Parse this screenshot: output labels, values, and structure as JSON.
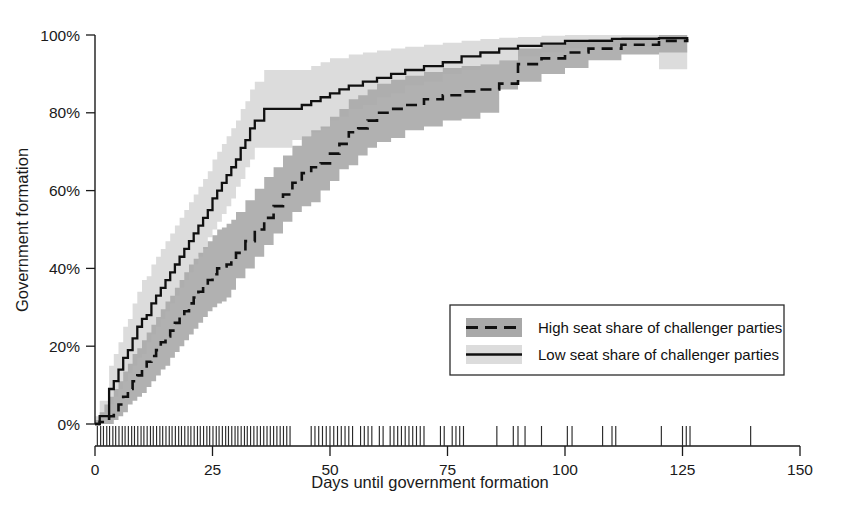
{
  "chart_data": {
    "type": "line",
    "title": "",
    "xlabel": "Days until government formation",
    "ylabel": "Government formation",
    "xlim": [
      0,
      150
    ],
    "ylim": [
      0,
      1
    ],
    "grid": false,
    "legend_position": "center-right",
    "x_ticks": [
      0,
      25,
      50,
      75,
      100,
      125,
      150
    ],
    "x_tick_labels": [
      "0",
      "25",
      "50",
      "75",
      "100",
      "125",
      "150"
    ],
    "y_ticks": [
      0,
      0.2,
      0.4,
      0.6,
      0.8,
      1.0
    ],
    "y_tick_labels": [
      "0%",
      "20%",
      "40%",
      "60%",
      "80%",
      "100%"
    ],
    "colors": {
      "curve": "#101010",
      "band_low_seat_share": "#dcdcdc",
      "band_high_seat_share": "#a8a8a8",
      "axis": "#1a1a1a",
      "background": "#ffffff"
    },
    "series": [
      {
        "name": "Low seat share of challenger parties",
        "style": "solid",
        "band_color": "#dcdcdc",
        "x": [
          0,
          1,
          2,
          3,
          4,
          5,
          6,
          7,
          8,
          9,
          10,
          11,
          12,
          13,
          14,
          15,
          16,
          17,
          18,
          19,
          20,
          21,
          22,
          23,
          24,
          25,
          26,
          27,
          28,
          29,
          30,
          31,
          32,
          33,
          34,
          36,
          38,
          40,
          42,
          44,
          46,
          48,
          50,
          52,
          54,
          57,
          60,
          63,
          66,
          70,
          74,
          78,
          82,
          86,
          90,
          95,
          100,
          110,
          120,
          126
        ],
        "y": [
          0.0,
          0.02,
          0.02,
          0.09,
          0.11,
          0.14,
          0.17,
          0.19,
          0.22,
          0.25,
          0.27,
          0.28,
          0.31,
          0.33,
          0.35,
          0.37,
          0.39,
          0.41,
          0.43,
          0.45,
          0.47,
          0.49,
          0.51,
          0.53,
          0.55,
          0.58,
          0.6,
          0.62,
          0.64,
          0.66,
          0.68,
          0.71,
          0.73,
          0.76,
          0.78,
          0.81,
          0.81,
          0.81,
          0.81,
          0.82,
          0.83,
          0.84,
          0.85,
          0.86,
          0.87,
          0.88,
          0.89,
          0.9,
          0.91,
          0.92,
          0.93,
          0.945,
          0.955,
          0.965,
          0.972,
          0.978,
          0.985,
          0.99,
          0.992,
          0.995
        ],
        "band_lower": [
          0.0,
          0.0,
          0.0,
          0.03,
          0.05,
          0.07,
          0.09,
          0.11,
          0.13,
          0.15,
          0.17,
          0.18,
          0.21,
          0.23,
          0.25,
          0.27,
          0.29,
          0.31,
          0.33,
          0.35,
          0.37,
          0.39,
          0.41,
          0.43,
          0.45,
          0.48,
          0.5,
          0.52,
          0.54,
          0.56,
          0.58,
          0.61,
          0.63,
          0.66,
          0.68,
          0.71,
          0.71,
          0.71,
          0.71,
          0.73,
          0.74,
          0.75,
          0.76,
          0.78,
          0.79,
          0.81,
          0.82,
          0.84,
          0.85,
          0.87,
          0.88,
          0.9,
          0.91,
          0.925,
          0.935,
          0.945,
          0.955,
          0.965,
          0.97,
          0.912
        ],
        "band_upper": [
          0.02,
          0.06,
          0.06,
          0.15,
          0.18,
          0.21,
          0.25,
          0.27,
          0.31,
          0.34,
          0.37,
          0.38,
          0.41,
          0.43,
          0.45,
          0.47,
          0.49,
          0.51,
          0.53,
          0.55,
          0.57,
          0.59,
          0.61,
          0.63,
          0.65,
          0.68,
          0.7,
          0.72,
          0.74,
          0.76,
          0.78,
          0.81,
          0.83,
          0.86,
          0.88,
          0.91,
          0.91,
          0.91,
          0.91,
          0.91,
          0.92,
          0.93,
          0.94,
          0.94,
          0.95,
          0.955,
          0.96,
          0.965,
          0.97,
          0.975,
          0.98,
          0.985,
          0.99,
          0.993,
          0.995,
          0.998,
          1.0,
          1.0,
          1.0,
          1.0
        ]
      },
      {
        "name": "High seat share of challenger parties",
        "style": "dashed",
        "band_color": "#a8a8a8",
        "x": [
          0,
          1,
          2,
          3,
          4,
          5,
          6,
          7,
          8,
          9,
          10,
          11,
          12,
          13,
          14,
          15,
          16,
          17,
          18,
          19,
          20,
          21,
          22,
          23,
          24,
          25,
          26,
          27,
          28,
          29,
          30,
          32,
          34,
          36,
          38,
          40,
          42,
          44,
          46,
          48,
          50,
          52,
          54,
          56,
          58,
          60,
          63,
          66,
          70,
          74,
          78,
          82,
          86,
          90,
          95,
          100,
          105,
          112,
          120,
          126
        ],
        "y": [
          0.0,
          0.005,
          0.01,
          0.02,
          0.03,
          0.05,
          0.07,
          0.09,
          0.11,
          0.125,
          0.14,
          0.16,
          0.175,
          0.19,
          0.21,
          0.225,
          0.24,
          0.26,
          0.275,
          0.29,
          0.31,
          0.325,
          0.34,
          0.355,
          0.37,
          0.385,
          0.4,
          0.405,
          0.41,
          0.42,
          0.44,
          0.47,
          0.5,
          0.53,
          0.56,
          0.59,
          0.62,
          0.645,
          0.66,
          0.67,
          0.695,
          0.72,
          0.75,
          0.76,
          0.78,
          0.8,
          0.81,
          0.82,
          0.835,
          0.845,
          0.855,
          0.86,
          0.875,
          0.925,
          0.94,
          0.955,
          0.965,
          0.975,
          0.985,
          0.99
        ],
        "band_lower": [
          0.0,
          0.0,
          0.0,
          0.0,
          0.0,
          0.01,
          0.02,
          0.03,
          0.05,
          0.06,
          0.07,
          0.08,
          0.095,
          0.11,
          0.125,
          0.14,
          0.15,
          0.17,
          0.185,
          0.2,
          0.215,
          0.23,
          0.245,
          0.26,
          0.275,
          0.29,
          0.3,
          0.31,
          0.315,
          0.325,
          0.345,
          0.375,
          0.4,
          0.43,
          0.46,
          0.49,
          0.52,
          0.545,
          0.56,
          0.57,
          0.6,
          0.625,
          0.655,
          0.665,
          0.69,
          0.71,
          0.725,
          0.735,
          0.755,
          0.765,
          0.78,
          0.785,
          0.8,
          0.86,
          0.88,
          0.9,
          0.915,
          0.935,
          0.95,
          0.955
        ],
        "band_upper": [
          0.01,
          0.03,
          0.05,
          0.07,
          0.09,
          0.11,
          0.135,
          0.155,
          0.18,
          0.195,
          0.215,
          0.235,
          0.255,
          0.275,
          0.295,
          0.315,
          0.33,
          0.35,
          0.37,
          0.39,
          0.41,
          0.425,
          0.44,
          0.455,
          0.47,
          0.485,
          0.5,
          0.505,
          0.515,
          0.525,
          0.545,
          0.575,
          0.605,
          0.635,
          0.66,
          0.69,
          0.715,
          0.74,
          0.755,
          0.765,
          0.79,
          0.81,
          0.835,
          0.845,
          0.86,
          0.875,
          0.885,
          0.895,
          0.905,
          0.915,
          0.92,
          0.925,
          0.935,
          0.965,
          0.975,
          0.985,
          0.99,
          0.995,
          1.0,
          1.0
        ]
      }
    ],
    "rug_marks": {
      "label": "observation-tick-marks",
      "x_values": [
        0.5,
        1.2,
        1.8,
        2.5,
        3.1,
        3.8,
        4.4,
        5.1,
        5.8,
        6.4,
        7.1,
        7.8,
        8.4,
        9.1,
        9.8,
        10.4,
        11.1,
        11.8,
        12.4,
        13.1,
        13.8,
        14.4,
        15.1,
        15.8,
        16.4,
        17.1,
        17.8,
        18.4,
        19.1,
        19.8,
        20.4,
        21.1,
        21.8,
        22.4,
        23.1,
        23.8,
        24.4,
        25.1,
        25.8,
        26.4,
        27.1,
        27.8,
        28.4,
        29.1,
        29.8,
        30.4,
        31.1,
        31.8,
        32.4,
        33.1,
        33.8,
        34.5,
        35.2,
        35.9,
        36.6,
        37.3,
        38.0,
        38.7,
        39.4,
        40.1,
        40.8,
        41.5,
        46.0,
        46.8,
        47.6,
        48.4,
        49.2,
        50.0,
        50.8,
        51.6,
        52.4,
        53.2,
        54.0,
        54.8,
        56.5,
        57.3,
        58.1,
        58.9,
        60.5,
        61.3,
        62.8,
        63.6,
        64.4,
        65.2,
        66.0,
        66.8,
        67.6,
        68.4,
        69.2,
        70.0,
        73.5,
        74.3,
        76.0,
        76.8,
        77.6,
        78.4,
        85.5,
        89.0,
        90.0,
        91.5,
        95.0,
        100.5,
        101.5,
        108.0,
        110.0,
        110.8,
        120.5,
        125.0,
        125.8,
        126.6,
        139.5
      ]
    }
  },
  "legend": {
    "items": [
      {
        "label": "High seat share of challenger parties",
        "style": "dashed",
        "swatch": "#a8a8a8"
      },
      {
        "label": "Low seat share of challenger parties",
        "style": "solid",
        "swatch": "#dcdcdc"
      }
    ]
  }
}
